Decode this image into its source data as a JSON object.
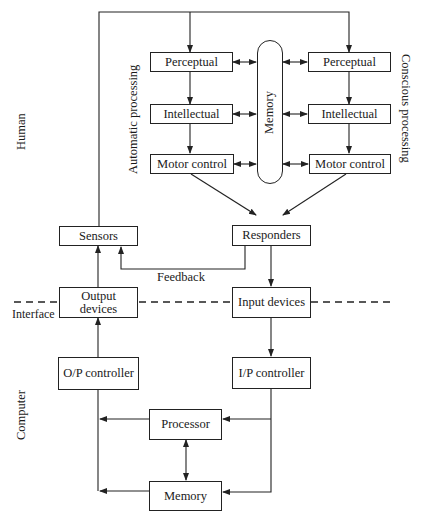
{
  "diagram": {
    "zones": {
      "human_label": "Human",
      "computer_label": "Computer",
      "interface_label": "Interface"
    },
    "side_labels": {
      "automatic": "Automatic processing",
      "conscious": "Conscious processing"
    },
    "human": {
      "automatic_column": {
        "perceptual": "Perceptual",
        "intellectual": "Intellectual",
        "motor_control": "Motor control"
      },
      "memory": "Memory",
      "conscious_column": {
        "perceptual": "Perceptual",
        "intellectual": "Intellectual",
        "motor_control": "Motor control"
      },
      "sensors": "Sensors",
      "responders": "Responders",
      "feedback_label": "Feedback"
    },
    "interface": {
      "output_devices": "Output devices",
      "input_devices": "Input devices"
    },
    "computer": {
      "op_controller": "O/P controller",
      "ip_controller": "I/P controller",
      "processor": "Processor",
      "memory": "Memory"
    },
    "edges": [
      {
        "from": "Sensors",
        "to": "Perceptual (automatic)"
      },
      {
        "from": "Sensors",
        "to": "Perceptual (conscious)"
      },
      {
        "from": "Perceptual (automatic)",
        "to": "Intellectual (automatic)"
      },
      {
        "from": "Intellectual (automatic)",
        "to": "Motor control (automatic)"
      },
      {
        "from": "Perceptual (conscious)",
        "to": "Intellectual (conscious)"
      },
      {
        "from": "Intellectual (conscious)",
        "to": "Motor control (conscious)"
      },
      {
        "from": "Memory",
        "to": "all processing boxes",
        "bidirectional": true
      },
      {
        "from": "Motor control (automatic)",
        "to": "Responders"
      },
      {
        "from": "Motor control (conscious)",
        "to": "Responders"
      },
      {
        "from": "Responders",
        "to": "Sensors",
        "label": "Feedback"
      },
      {
        "from": "Responders",
        "to": "Input devices"
      },
      {
        "from": "Output devices",
        "to": "Sensors"
      },
      {
        "from": "Input devices",
        "to": "I/P controller"
      },
      {
        "from": "O/P controller",
        "to": "Output devices"
      },
      {
        "from": "I/P controller",
        "to": "Processor"
      },
      {
        "from": "I/P controller",
        "to": "Memory"
      },
      {
        "from": "Processor",
        "to": "O/P controller"
      },
      {
        "from": "Memory",
        "to": "O/P controller"
      },
      {
        "from": "Processor",
        "to": "Memory",
        "bidirectional": true
      }
    ]
  }
}
